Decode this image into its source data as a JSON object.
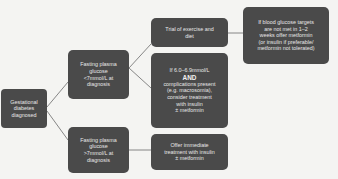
{
  "diagram": {
    "nodes": {
      "root": {
        "lines": [
          "Gestational",
          "diabetes",
          "diagnosed"
        ]
      },
      "fpg_low": {
        "lines": [
          "Fasting plasma",
          "glucose",
          "<7mmol/L at",
          "diagnosis"
        ]
      },
      "fpg_high": {
        "lines": [
          "Fasting plasma",
          "glucose",
          ">7mmol/L at",
          "diagnosis"
        ]
      },
      "trial": {
        "lines": [
          "Trial of exercise and",
          "diet"
        ]
      },
      "metformin": {
        "lines": [
          "If blood glucose targets",
          "are not met in 1–2",
          "weeks offer metformin",
          "(or insulin if preferable/",
          "metformin not tolerated)"
        ]
      },
      "complications": {
        "line1": "If 6.0–6.9mmol/L",
        "and_label": "AND",
        "rest": [
          "complications present",
          "(e.g. macrosomia),",
          "consider treatment",
          "with insulin",
          "± metformin"
        ]
      },
      "immediate": {
        "lines": [
          "Offer immediate",
          "treatment with insulin",
          "± metformin"
        ]
      }
    },
    "edges": [
      {
        "from": "root",
        "to": "fpg_low"
      },
      {
        "from": "root",
        "to": "fpg_high"
      },
      {
        "from": "fpg_low",
        "to": "trial"
      },
      {
        "from": "fpg_low",
        "to": "complications"
      },
      {
        "from": "trial",
        "to": "metformin"
      },
      {
        "from": "fpg_high",
        "to": "immediate"
      }
    ],
    "colors": {
      "node_fill": "#4a4a4a",
      "node_text": "#e8e8e8",
      "edge": "#6a6a6a",
      "background": "#f4f4f2"
    }
  }
}
